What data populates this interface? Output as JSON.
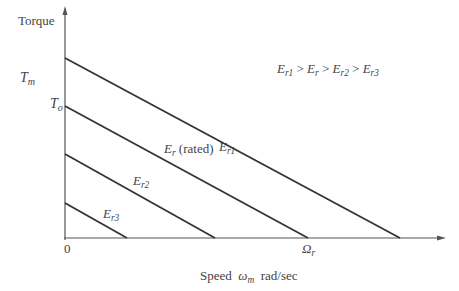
{
  "diagram": {
    "y_axis_label": "Torque",
    "x_axis_label_prefix": "Speed",
    "x_axis_label_symbol": "ω",
    "x_axis_label_symbol_sub": "m",
    "x_axis_label_units": "rad/sec",
    "origin_label": "0",
    "tm_label": "T",
    "tm_sub": "m",
    "to_label": "T",
    "to_sub": "o",
    "omega_r_label": "Ω",
    "omega_r_sub": "r",
    "relation": {
      "e1": "E",
      "e1_sub": "r1",
      "gt": ">",
      "e2": "E",
      "e2_sub": "r",
      "e3": "E",
      "e3_sub": "r2",
      "e4": "E",
      "e4_sub": "r3"
    },
    "lines": [
      {
        "label": "E",
        "sub": "r1",
        "suffix": ""
      },
      {
        "label": "E",
        "sub": "r",
        "suffix": "(rated)"
      },
      {
        "label": "E",
        "sub": "r2",
        "suffix": ""
      },
      {
        "label": "E",
        "sub": "r3",
        "suffix": ""
      }
    ]
  }
}
